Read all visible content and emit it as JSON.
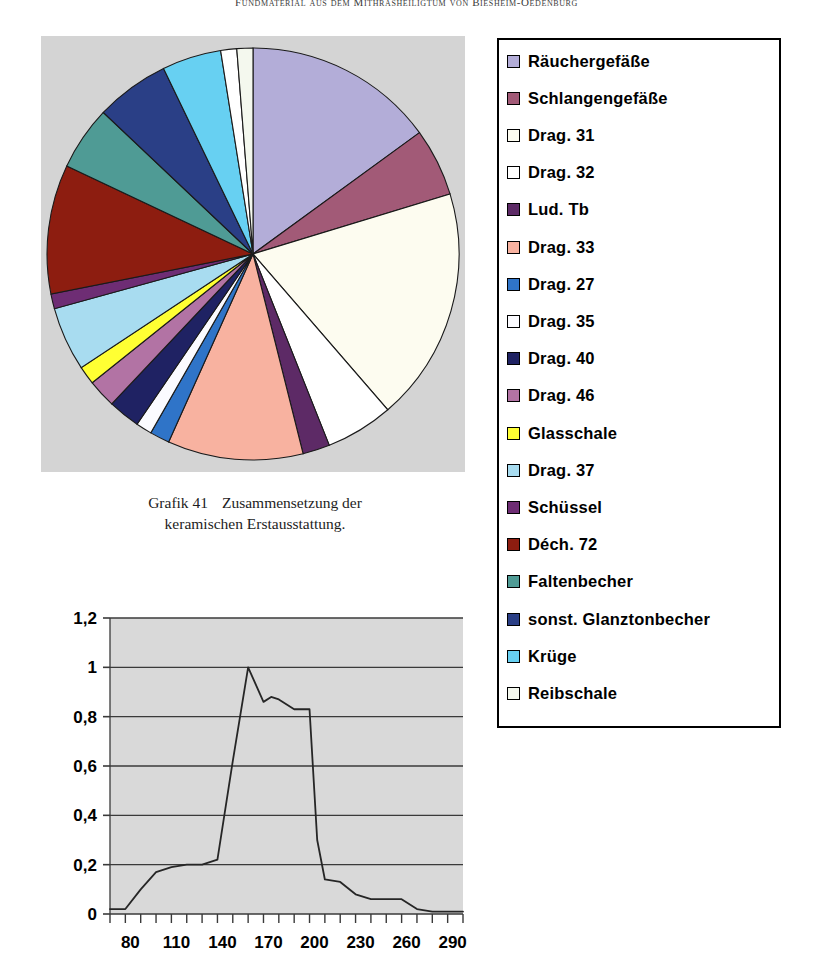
{
  "header": {
    "running_title": "Fundmaterial aus dem Mithrasheiligtum von Biesheim-Oedenburg"
  },
  "pie_caption": {
    "number": "Grafik 41",
    "text_line1": "Zusammensetzung der",
    "text_line2": "keramischen Erstausstattung."
  },
  "legend": {
    "items": [
      {
        "label": "Räuchergefäße",
        "color": "#b3add8"
      },
      {
        "label": "Schlangengefäße",
        "color": "#a25a77"
      },
      {
        "label": "Drag. 31",
        "color": "#fdfcf0"
      },
      {
        "label": "Drag. 32",
        "color": "#ffffff"
      },
      {
        "label": "Lud. Tb",
        "color": "#5d2a66"
      },
      {
        "label": "Drag. 33",
        "color": "#f8b2a0"
      },
      {
        "label": "Drag. 27",
        "color": "#2f74c8"
      },
      {
        "label": "Drag. 35",
        "color": "#fbfbff"
      },
      {
        "label": " Drag. 40",
        "color": "#1f2263"
      },
      {
        "label": "Drag. 46",
        "color": "#b273a4"
      },
      {
        "label": "Glasschale",
        "color": "#ffff33"
      },
      {
        "label": "Drag. 37",
        "color": "#a8dcf0"
      },
      {
        "label": "Schüssel",
        "color": "#6e2d74"
      },
      {
        "label": "Déch. 72",
        "color": "#8d1d10"
      },
      {
        "label": "Faltenbecher",
        "color": "#4f9b95"
      },
      {
        "label": "sonst. Glanztonbecher",
        "color": "#2a3f86"
      },
      {
        "label": "Krüge",
        "color": "#67d0f2"
      },
      {
        "label": "Reibschale",
        "color": "#f4f8ee"
      }
    ]
  },
  "chart_data": [
    {
      "type": "pie",
      "title": "Zusammensetzung der keramischen Erstausstattung",
      "legend_position": "right",
      "start_angle_deg": 0,
      "direction": "clockwise",
      "categories": [
        "Räuchergefäße",
        "Schlangengefäße",
        "Drag. 31",
        "Drag. 32",
        "Lud. Tb",
        "Drag. 33",
        "Drag. 27",
        "Drag. 35",
        " Drag. 40",
        "Drag. 46",
        "Glasschale",
        "Drag. 37",
        "Schüssel",
        "Déch. 72",
        "Faltenbecher",
        "sonst. Glanztonbecher",
        "Krüge",
        "Topf",
        "Reibschale"
      ],
      "values": [
        15.5,
        5.5,
        19.0,
        5.5,
        2.2,
        11.0,
        1.6,
        1.3,
        2.6,
        2.3,
        1.5,
        5.2,
        1.2,
        10.5,
        5.2,
        6.0,
        4.8,
        1.3,
        1.3
      ],
      "unit": "percent",
      "colors": [
        "#b3add8",
        "#a25a77",
        "#fdfcf0",
        "#ffffff",
        "#5d2a66",
        "#f8b2a0",
        "#2f74c8",
        "#fbfbff",
        "#1f2263",
        "#b273a4",
        "#ffff33",
        "#a8dcf0",
        "#6e2d74",
        "#8d1d10",
        "#4f9b95",
        "#2a3f86",
        "#67d0f2",
        "#ffffff",
        "#f4f8ee"
      ]
    },
    {
      "type": "line",
      "title": "",
      "xlabel": "",
      "ylabel": "",
      "grid": true,
      "plot_background": "#d9d9d9",
      "ylim": [
        0,
        1.2
      ],
      "yticks": [
        "0",
        "0,2",
        "0,4",
        "0,6",
        "0,8",
        "1",
        "1,2"
      ],
      "ytick_values": [
        0,
        0.2,
        0.4,
        0.6,
        0.8,
        1.0,
        1.2
      ],
      "xlim": [
        70,
        300
      ],
      "xticks": [
        "80",
        "110",
        "140",
        "170",
        "200",
        "230",
        "260",
        "290"
      ],
      "xtick_values": [
        80,
        110,
        140,
        170,
        200,
        230,
        260,
        290
      ],
      "x": [
        70,
        80,
        90,
        100,
        110,
        120,
        130,
        140,
        150,
        160,
        170,
        175,
        180,
        190,
        195,
        200,
        205,
        210,
        220,
        230,
        240,
        250,
        260,
        270,
        280,
        290,
        300
      ],
      "values": [
        0.02,
        0.02,
        0.1,
        0.17,
        0.19,
        0.2,
        0.2,
        0.22,
        0.62,
        1.0,
        0.86,
        0.88,
        0.87,
        0.83,
        0.83,
        0.83,
        0.3,
        0.14,
        0.13,
        0.08,
        0.06,
        0.06,
        0.06,
        0.02,
        0.01,
        0.01,
        0.01
      ]
    }
  ]
}
